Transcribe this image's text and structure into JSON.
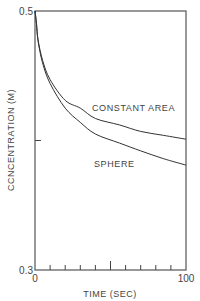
{
  "chart_data": {
    "type": "line",
    "title": "",
    "xlabel": "TIME (SEC)",
    "ylabel": "CCNCENTRATION (M)",
    "xlim": [
      0,
      100
    ],
    "ylim": [
      0.3,
      0.5
    ],
    "x_tick_labels": [
      "0",
      "100"
    ],
    "y_tick_labels": [
      "0.3",
      "0.5"
    ],
    "x_minor_ticks": [
      10,
      20,
      30,
      40,
      50,
      60,
      70,
      80,
      90
    ],
    "y_minor_ticks": [
      0.4
    ],
    "grid": false,
    "legend": "inline labels",
    "series": [
      {
        "name": "CONSTANT AREA",
        "x": [
          0,
          1,
          2,
          5,
          10,
          20,
          30,
          40,
          56,
          70,
          85,
          100
        ],
        "values": [
          0.5,
          0.49,
          0.478,
          0.462,
          0.447,
          0.431,
          0.425,
          0.417,
          0.412,
          0.407,
          0.404,
          0.401
        ]
      },
      {
        "name": "SPHERE",
        "x": [
          0,
          1,
          2,
          5,
          10,
          20,
          30,
          40,
          56,
          70,
          85,
          100
        ],
        "values": [
          0.5,
          0.49,
          0.477,
          0.46,
          0.444,
          0.425,
          0.414,
          0.405,
          0.398,
          0.392,
          0.386,
          0.381
        ]
      }
    ],
    "annotations": [
      {
        "text": "CONSTANT AREA",
        "near_series": "CONSTANT AREA"
      },
      {
        "text": "SPHERE",
        "near_series": "SPHERE"
      }
    ]
  },
  "labels": {
    "y_top": "0.5",
    "y_bottom": "0.3",
    "x_left": "0",
    "x_right": "100",
    "xlabel": "TIME (SEC)",
    "ylabel": "CCNCENTRATION (M)",
    "series_a": "CONSTANT AREA",
    "series_b": "SPHERE"
  }
}
